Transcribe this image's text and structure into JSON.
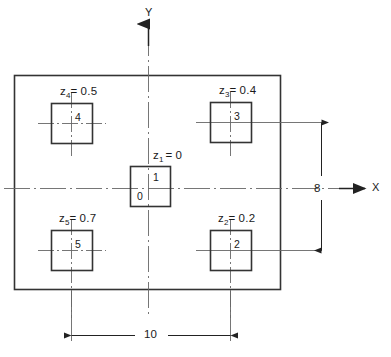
{
  "diagram": {
    "axes": {
      "x_label": "X",
      "y_label": "Y"
    },
    "dimensions": [
      {
        "name": "vertical-height",
        "value": "8",
        "orientation": "vertical"
      },
      {
        "name": "horizontal-width",
        "value": "10",
        "orientation": "horizontal"
      }
    ],
    "elements": [
      {
        "id": "panel-4",
        "cell_number": "4",
        "label_var": "z",
        "label_sub": "4",
        "label_eq": "=",
        "label_value": "0.5",
        "position": "upper-left"
      },
      {
        "id": "panel-3",
        "cell_number": "3",
        "label_var": "z",
        "label_sub": "3",
        "label_eq": "=",
        "label_value": "0.4",
        "position": "upper-right"
      },
      {
        "id": "panel-1",
        "cell_number": "1",
        "cell_number_secondary": "0",
        "label_var": "z",
        "label_sub": "1",
        "label_eq": "=",
        "label_value": "0",
        "position": "center"
      },
      {
        "id": "panel-5",
        "cell_number": "5",
        "label_var": "z",
        "label_sub": "5",
        "label_eq": "=",
        "label_value": "0.7",
        "position": "lower-left"
      },
      {
        "id": "panel-2",
        "cell_number": "2",
        "label_var": "z",
        "label_sub": "2",
        "label_eq": "=",
        "label_value": "0.2",
        "position": "lower-right"
      }
    ],
    "colors": {
      "line": "#333333",
      "thin_line": "#555555",
      "text": "#1a1a1a",
      "background": "#ffffff"
    }
  }
}
